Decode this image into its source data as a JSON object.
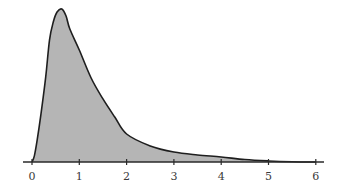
{
  "chart_data": {
    "type": "area",
    "title": "",
    "xlabel": "",
    "ylabel": "",
    "x_ticks": [
      0,
      1,
      2,
      3,
      4,
      5,
      6
    ],
    "tick_labels": [
      "0",
      "1",
      "2",
      "3",
      "4",
      "5",
      "6"
    ],
    "xlim": [
      -0.2,
      6.2
    ],
    "ylim": [
      0,
      1
    ],
    "grid": false,
    "y_axis_shown": false,
    "series": [
      {
        "name": "density",
        "x": [
          0,
          0.05,
          0.11,
          0.19,
          0.29,
          0.37,
          0.45,
          0.53,
          0.63,
          0.72,
          0.8,
          1.0,
          1.25,
          1.5,
          1.75,
          2.0,
          2.5,
          3.0,
          3.5,
          4.0,
          4.5,
          5.0,
          5.5,
          6.0
        ],
        "values": [
          0,
          0.04,
          0.144,
          0.314,
          0.556,
          0.797,
          0.915,
          0.98,
          1.0,
          0.954,
          0.869,
          0.732,
          0.549,
          0.412,
          0.294,
          0.183,
          0.105,
          0.065,
          0.046,
          0.033,
          0.016,
          0.007,
          0.002,
          0
        ]
      }
    ],
    "colors": {
      "fill": "#b5b5b5",
      "line": "#1e1e1e",
      "axis": "#2a2a2a",
      "label": "#3a3a3a"
    }
  }
}
